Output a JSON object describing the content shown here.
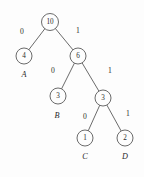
{
  "figure": {
    "kind": "binary-tree-diagram",
    "background_color": "#fdfdfd",
    "stroke_color": "#5a5a5a",
    "text_color": "#2b2b2b"
  },
  "chart_data": {
    "type": "diagram",
    "title": "",
    "nodes": [
      {
        "id": "n10",
        "value": "10",
        "x": 50,
        "y": 22,
        "r": 8.5,
        "role": "root"
      },
      {
        "id": "n4",
        "value": "4",
        "x": 24,
        "y": 56,
        "r": 8.0,
        "role": "leaf"
      },
      {
        "id": "n6",
        "value": "6",
        "x": 78,
        "y": 56,
        "r": 8.0,
        "role": "internal"
      },
      {
        "id": "n3a",
        "value": "3",
        "x": 58,
        "y": 96,
        "r": 8.0,
        "role": "leaf"
      },
      {
        "id": "n3b",
        "value": "3",
        "x": 103,
        "y": 98,
        "r": 8.0,
        "role": "internal"
      },
      {
        "id": "n1",
        "value": "1",
        "x": 85,
        "y": 138,
        "r": 8.0,
        "role": "leaf"
      },
      {
        "id": "n2",
        "value": "2",
        "x": 125,
        "y": 138,
        "r": 8.0,
        "role": "leaf"
      }
    ],
    "edges": [
      {
        "from": "n10",
        "to": "n4",
        "label": "0",
        "label_x": 22,
        "label_y": 31
      },
      {
        "from": "n10",
        "to": "n6",
        "label": "1",
        "label_x": 78,
        "label_y": 30
      },
      {
        "from": "n6",
        "to": "n3a",
        "label": "0",
        "label_x": 53,
        "label_y": 70
      },
      {
        "from": "n6",
        "to": "n3b",
        "label": "1",
        "label_x": 110,
        "label_y": 70
      },
      {
        "from": "n3b",
        "to": "n1",
        "label": "0",
        "label_x": 85,
        "label_y": 116
      },
      {
        "from": "n3b",
        "to": "n2",
        "label": "1",
        "label_x": 128,
        "label_y": 113
      }
    ],
    "leaf_labels": [
      {
        "id": "lblA",
        "text": "A",
        "x": 24,
        "y": 74,
        "node": "n4"
      },
      {
        "id": "lblB",
        "text": "B",
        "x": 57,
        "y": 115,
        "node": "n3a"
      },
      {
        "id": "lblC",
        "text": "C",
        "x": 85,
        "y": 156,
        "node": "n1"
      },
      {
        "id": "lblD",
        "text": "D",
        "x": 125,
        "y": 156,
        "node": "n2"
      }
    ]
  }
}
